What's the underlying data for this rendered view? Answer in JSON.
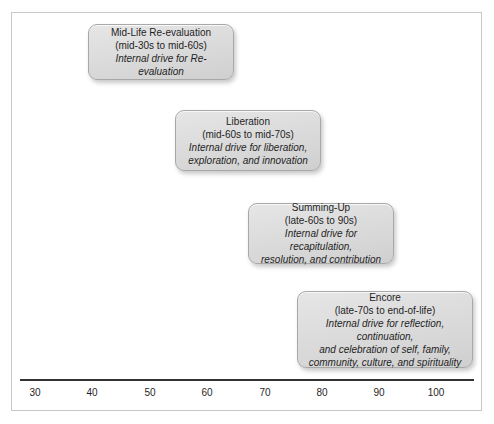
{
  "figure": {
    "background_color": "#ffffff",
    "frame_color": "#c8c8c8",
    "box_fill_color": "#dedede",
    "box_border_color": "#a8a8a8",
    "axis_color": "#333333",
    "text_color": "#1f1f1f"
  },
  "chart_data": {
    "type": "table",
    "title": "",
    "xlabel": "",
    "ylabel": "",
    "xlim": [
      26,
      106
    ],
    "grid": false,
    "legend": "none",
    "axis": {
      "tick_labels": [
        "30",
        "40",
        "50",
        "60",
        "70",
        "80",
        "90",
        "100"
      ],
      "tick_values": [
        30,
        40,
        50,
        60,
        70,
        80,
        90,
        100
      ]
    },
    "categories": [
      "Mid-Life Re-evaluation",
      "Liberation",
      "Summing-Up",
      "Encore"
    ],
    "series": [
      {
        "name": "Age span (years)",
        "values": [
          [
            35,
            65
          ],
          [
            65,
            75
          ],
          [
            67,
            99
          ],
          [
            77,
            100
          ]
        ]
      }
    ]
  },
  "stages": [
    {
      "id": "mid-life-re-evaluation",
      "title": "Mid-Life Re-evaluation",
      "range": "(mid-30s to mid-60s)",
      "description": "Internal drive for Re-evaluation",
      "left": 88,
      "top": 24,
      "width": 146,
      "height": 56
    },
    {
      "id": "liberation",
      "title": "Liberation",
      "range": "(mid-60s to mid-70s)",
      "description": "Internal drive for liberation,\nexploration, and innovation",
      "left": 175,
      "top": 110,
      "width": 146,
      "height": 61
    },
    {
      "id": "summing-up",
      "title": "Summing-Up",
      "range": "(late-60s to 90s)",
      "description": "Internal drive for recapitulation,\nresolution, and contribution",
      "left": 248,
      "top": 203,
      "width": 146,
      "height": 61
    },
    {
      "id": "encore",
      "title": "Encore",
      "range": "(late-70s to end-of-life)",
      "description": "Internal drive for reflection, continuation,\nand celebration of self, family,\ncommunity, culture, and spirituality",
      "left": 297,
      "top": 291,
      "width": 176,
      "height": 77
    }
  ],
  "axis": {
    "ticks": [
      {
        "label": "30",
        "x": 35
      },
      {
        "label": "40",
        "x": 92
      },
      {
        "label": "50",
        "x": 150
      },
      {
        "label": "60",
        "x": 207
      },
      {
        "label": "70",
        "x": 265
      },
      {
        "label": "80",
        "x": 322
      },
      {
        "label": "90",
        "x": 379
      },
      {
        "label": "100",
        "x": 436
      }
    ]
  }
}
